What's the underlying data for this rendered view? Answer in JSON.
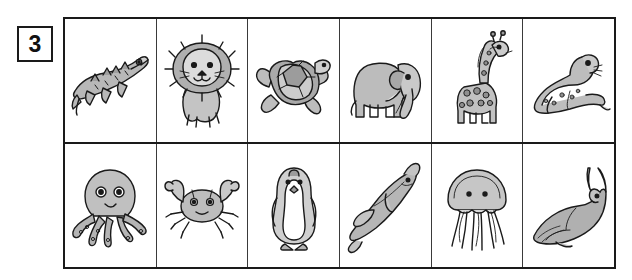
{
  "exercise": {
    "number": "3"
  },
  "grid": {
    "rows": [
      {
        "name": "land-animals-row",
        "cells": [
          {
            "label": "crocodile",
            "icon": "crocodile-icon"
          },
          {
            "label": "lion",
            "icon": "lion-icon"
          },
          {
            "label": "turtle",
            "icon": "turtle-icon"
          },
          {
            "label": "elephant",
            "icon": "elephant-icon"
          },
          {
            "label": "giraffe",
            "icon": "giraffe-icon"
          },
          {
            "label": "seal",
            "icon": "seal-icon"
          }
        ]
      },
      {
        "name": "sea-animals-row",
        "cells": [
          {
            "label": "octopus",
            "icon": "octopus-icon"
          },
          {
            "label": "crab",
            "icon": "crab-icon"
          },
          {
            "label": "penguin",
            "icon": "penguin-icon"
          },
          {
            "label": "dolphin",
            "icon": "dolphin-icon"
          },
          {
            "label": "jellyfish",
            "icon": "jellyfish-icon"
          },
          {
            "label": "whale",
            "icon": "whale-icon"
          }
        ]
      }
    ]
  },
  "colors": {
    "ink": "#1a1a1a",
    "fill_light": "#cfcfcf",
    "fill_mid": "#b4b4b4",
    "fill_dark": "#8f8f8f",
    "page": "#ffffff"
  }
}
